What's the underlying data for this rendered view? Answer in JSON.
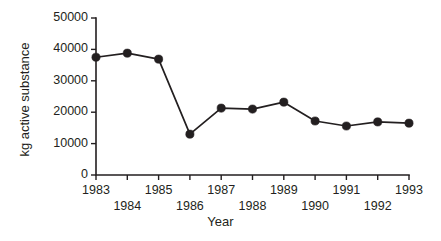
{
  "chart_data": {
    "type": "line",
    "title": "",
    "xlabel": "Year",
    "ylabel": "kg active substance",
    "x": [
      1983,
      1984,
      1985,
      1986,
      1987,
      1988,
      1989,
      1990,
      1991,
      1992,
      1993
    ],
    "values": [
      37500,
      38800,
      36900,
      13000,
      21300,
      21000,
      23200,
      17200,
      15600,
      16900,
      16500
    ],
    "categories": [
      "1983",
      "1984",
      "1985",
      "1986",
      "1987",
      "1988",
      "1989",
      "1990",
      "1991",
      "1992",
      "1993"
    ],
    "xlim": [
      1983,
      1993
    ],
    "ylim": [
      0,
      50000
    ],
    "yticks": [
      0,
      10000,
      20000,
      30000,
      40000,
      50000
    ],
    "ytick_labels": [
      "0",
      "10000",
      "20000",
      "30000",
      "40000",
      "50000"
    ],
    "xticks": [
      1983,
      1984,
      1985,
      1986,
      1987,
      1988,
      1989,
      1990,
      1991,
      1992,
      1993
    ],
    "xtick_labels": [
      "1983",
      "1984",
      "1985",
      "1986",
      "1987",
      "1988",
      "1989",
      "1990",
      "1991",
      "1992",
      "1993"
    ],
    "xtick_label_rows": [
      {
        "row": "top",
        "labels": [
          "1983",
          "1985",
          "1987",
          "1989",
          "1991",
          "1993"
        ]
      },
      {
        "row": "bottom",
        "labels": [
          "1984",
          "1986",
          "1988",
          "1990",
          "1992"
        ]
      }
    ],
    "grid": false,
    "legend": null,
    "marker": "filled-circle",
    "line_color": "#231f20",
    "marker_color": "#231f20",
    "background_color": "#ffffff"
  },
  "axes": {
    "y_title": "kg active substance",
    "x_title": "Year"
  }
}
